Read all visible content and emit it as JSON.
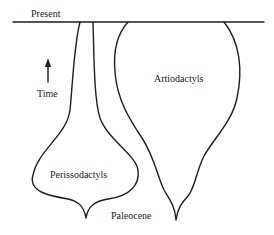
{
  "diagram": {
    "type": "spindle-diagram",
    "top_label": "Present",
    "bottom_label": "Paleocene",
    "axis": {
      "label": "Time",
      "direction": "up"
    },
    "clades": [
      {
        "name": "Perissodactyls",
        "trend": "diverse early, declining toward present"
      },
      {
        "name": "Artiodactyls",
        "trend": "expanding toward present"
      }
    ],
    "colors": {
      "line": "#1e1e1e",
      "text": "#222222",
      "background": "#ffffff"
    }
  }
}
